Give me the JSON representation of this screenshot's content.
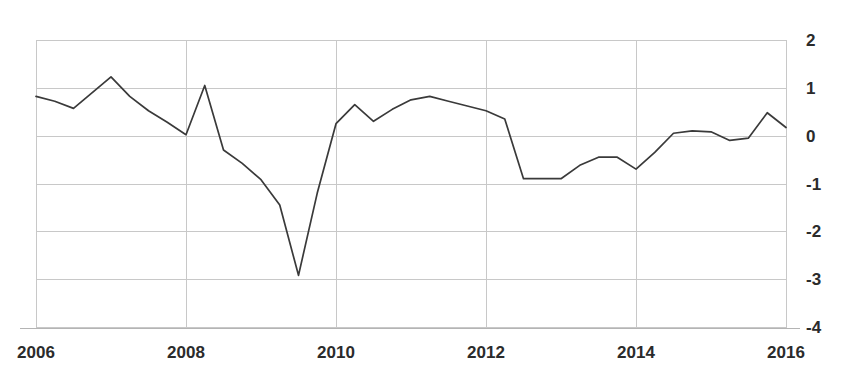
{
  "chart_data": {
    "type": "line",
    "title": "",
    "subtitle": "",
    "xlabel": "",
    "ylabel": "",
    "xlim": [
      2006,
      2016
    ],
    "ylim": [
      -4,
      2
    ],
    "grid": true,
    "legend": null,
    "x_tick_labels": [
      "2006",
      "2008",
      "2010",
      "2012",
      "2014",
      "2016"
    ],
    "x_tick_values": [
      2006,
      2008,
      2010,
      2012,
      2014,
      2016
    ],
    "y_tick_labels": [
      "2",
      "1",
      "0",
      "-1",
      "-2",
      "-3",
      "-4"
    ],
    "y_tick_values": [
      2,
      1,
      0,
      -1,
      -2,
      -3,
      -4
    ],
    "y_axis_position": "right",
    "line_color": "#3a3a3a",
    "grid_color": "#c8c8c8",
    "series": [
      {
        "name": "series-1",
        "x": [
          2006.0,
          2006.25,
          2006.5,
          2006.75,
          2007.0,
          2007.25,
          2007.5,
          2007.75,
          2008.0,
          2008.25,
          2008.5,
          2008.75,
          2009.0,
          2009.25,
          2009.5,
          2009.75,
          2010.0,
          2010.25,
          2010.5,
          2010.75,
          2011.0,
          2011.25,
          2011.5,
          2011.75,
          2012.0,
          2012.25,
          2012.5,
          2012.75,
          2013.0,
          2013.25,
          2013.5,
          2013.75,
          2014.0,
          2014.25,
          2014.5,
          2014.75,
          2015.0,
          2015.25,
          2015.5,
          2015.75,
          2016.0
        ],
        "values": [
          0.82,
          0.72,
          0.57,
          0.9,
          1.23,
          0.82,
          0.52,
          0.28,
          0.02,
          1.05,
          -0.3,
          -0.58,
          -0.92,
          -1.45,
          -2.92,
          -1.2,
          0.25,
          0.65,
          0.3,
          0.55,
          0.75,
          0.82,
          0.72,
          0.62,
          0.52,
          0.35,
          -0.9,
          -0.9,
          -0.9,
          -0.62,
          -0.45,
          -0.45,
          -0.7,
          -0.35,
          0.05,
          0.1,
          0.08,
          -0.1,
          -0.05,
          0.48,
          0.17
        ]
      }
    ]
  }
}
